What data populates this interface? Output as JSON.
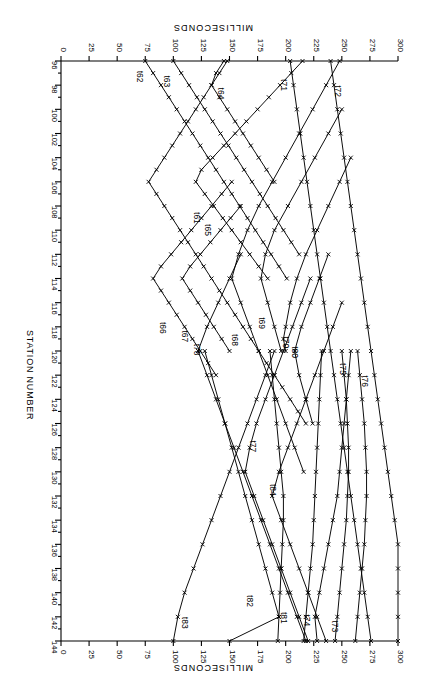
{
  "figure": {
    "rotation_deg": 180,
    "background": "#ffffff",
    "ink": "#000000",
    "marker": "x"
  },
  "axes": {
    "time_axis": {
      "title": "MILLISECONDS",
      "title_top": "MILLISECONDS",
      "title_bottom": "MILLISECONDS",
      "unit": "ms",
      "min": 0,
      "max": 300,
      "tick_step": 25,
      "ticks": [
        300,
        275,
        250,
        225,
        200,
        175,
        150,
        125,
        100,
        75,
        50,
        25,
        0
      ],
      "tick_labels": [
        "300",
        "275",
        "250",
        "225",
        "200",
        "175",
        "150",
        "125",
        "100",
        "75",
        "50",
        "25",
        "0"
      ],
      "direction": "decreasing-left-to-right"
    },
    "station_axis": {
      "title": "STATION NUMBER",
      "min": 96,
      "max": 144,
      "tick_step": 2,
      "minor_step": 1,
      "ticks": [
        96,
        98,
        100,
        102,
        104,
        106,
        108,
        110,
        112,
        114,
        116,
        118,
        120,
        122,
        124,
        126,
        128,
        130,
        132,
        134,
        136,
        138,
        140,
        142,
        144
      ],
      "tick_labels": [
        "96",
        "98",
        "100",
        "102",
        "104",
        "106",
        "108",
        "110",
        "112",
        "114",
        "116",
        "118",
        "120",
        "122",
        "124",
        "126",
        "128",
        "130",
        "132",
        "134",
        "136",
        "138",
        "140",
        "142",
        "144"
      ]
    }
  },
  "chart_data": {
    "type": "line",
    "title": "",
    "subtitle": "",
    "xlabel": "MILLISECONDS",
    "ylabel": "STATION NUMBER",
    "xlim": [
      0,
      300
    ],
    "ylim": [
      96,
      144
    ],
    "grid": false,
    "legend": "inline-curve-labels",
    "marker": "x",
    "x_is_time_ms": true,
    "series": [
      {
        "name": "t61",
        "label": "t61",
        "shot_station": 106,
        "label_station": 108.5,
        "label_time_ms": 118,
        "stations": [
          96,
          97,
          98,
          99,
          100,
          101,
          102,
          103,
          104,
          105,
          106,
          107,
          108,
          109,
          110,
          111,
          112,
          113,
          114,
          115,
          116,
          117,
          118,
          119,
          120,
          121,
          122,
          123,
          124,
          125,
          126
        ],
        "times_ms": [
          148,
          141,
          134,
          127,
          120,
          113,
          106,
          99,
          92,
          85,
          78,
          85,
          92,
          99,
          106,
          113,
          120,
          127,
          134,
          141,
          148,
          155,
          162,
          169,
          176,
          183,
          190,
          197,
          204,
          211,
          218
        ]
      },
      {
        "name": "t62",
        "label": "t62",
        "shot_station": 96,
        "label_station": 96.8,
        "label_time_ms": 68,
        "stations": [
          96,
          97,
          98,
          99,
          100,
          101,
          102,
          103,
          104,
          105,
          106,
          107,
          108,
          109,
          110,
          111,
          112,
          113,
          114
        ],
        "times_ms": [
          75,
          82,
          89,
          96,
          103,
          110,
          117,
          124,
          131,
          138,
          145,
          152,
          159,
          166,
          173,
          180,
          187,
          194,
          201
        ]
      },
      {
        "name": "t63",
        "label": "t63",
        "shot_station": 96,
        "label_station": 97.2,
        "label_time_ms": 92,
        "stations": [
          96,
          97,
          98,
          99,
          100,
          101,
          102,
          103,
          104,
          105,
          106,
          107,
          108,
          109,
          110,
          111,
          112
        ],
        "times_ms": [
          100,
          107,
          114,
          121,
          128,
          135,
          142,
          149,
          156,
          163,
          170,
          177,
          184,
          191,
          198,
          205,
          212
        ]
      },
      {
        "name": "t64",
        "label": "t64",
        "shot_station": 97,
        "label_station": 98.2,
        "label_time_ms": 140,
        "stations": [
          96,
          97,
          98,
          99,
          100,
          101,
          102,
          103,
          104,
          105,
          106
        ],
        "times_ms": [
          145,
          138,
          134,
          141,
          148,
          155,
          162,
          169,
          176,
          183,
          190
        ]
      },
      {
        "name": "t65",
        "label": "t65",
        "shot_station": 106,
        "label_station": 109.5,
        "label_time_ms": 128,
        "stations": [
          96,
          97,
          98,
          99,
          100,
          101,
          102,
          103,
          104,
          105,
          106,
          107,
          108,
          109,
          110,
          111,
          112,
          113,
          114
        ],
        "times_ms": [
          215,
          205,
          195,
          185,
          175,
          165,
          155,
          145,
          135,
          125,
          120,
          128,
          136,
          144,
          152,
          160,
          168,
          176,
          184
        ]
      },
      {
        "name": "t66",
        "label": "t66",
        "shot_station": 114,
        "label_station": 117.6,
        "label_time_ms": 88,
        "stations": [
          106,
          107,
          108,
          109,
          110,
          111,
          112,
          113,
          114,
          115,
          116,
          117,
          118,
          119,
          120,
          121,
          122
        ],
        "times_ms": [
          152,
          143,
          134,
          125,
          116,
          107,
          98,
          89,
          82,
          89,
          96,
          103,
          110,
          117,
          124,
          131,
          138
        ]
      },
      {
        "name": "t67",
        "label": "t67",
        "shot_station": 114,
        "label_station": 118.3,
        "label_time_ms": 108,
        "stations": [
          108,
          109,
          110,
          111,
          112,
          113,
          114,
          115,
          116,
          117,
          118,
          119,
          120
        ],
        "times_ms": [
          160,
          151,
          142,
          133,
          124,
          115,
          108,
          115,
          122,
          129,
          136,
          143,
          150
        ]
      },
      {
        "name": "t68",
        "label": "t68",
        "shot_station": 114,
        "label_station": 118.6,
        "label_time_ms": 152,
        "stations": [
          96,
          98,
          100,
          102,
          104,
          106,
          108,
          110,
          112,
          114,
          116,
          118,
          120,
          122,
          124,
          126,
          128,
          130
        ],
        "times_ms": [
          248,
          236,
          224,
          212,
          200,
          188,
          176,
          166,
          158,
          152,
          160,
          168,
          176,
          184,
          192,
          200,
          208,
          216
        ]
      },
      {
        "name": "t69",
        "label": "t69",
        "shot_station": 114,
        "label_station": 117.2,
        "label_time_ms": 176,
        "stations": [
          100,
          102,
          104,
          106,
          108,
          110,
          112,
          114,
          116,
          118,
          120
        ],
        "times_ms": [
          250,
          238,
          226,
          214,
          202,
          190,
          182,
          178,
          184,
          190,
          196
        ]
      },
      {
        "name": "t70",
        "label": "t70",
        "shot_station": 119,
        "label_station": 118.8,
        "label_time_ms": 198,
        "stations": [
          104,
          106,
          108,
          110,
          112,
          114,
          116,
          118,
          119,
          120
        ],
        "times_ms": [
          258,
          248,
          238,
          228,
          218,
          210,
          204,
          200,
          198,
          200
        ]
      },
      {
        "name": "t71",
        "label": "t71",
        "shot_station": 96,
        "label_station": 97.5,
        "label_time_ms": 196,
        "stations": [
          96,
          98,
          100,
          102,
          104,
          106,
          108,
          110,
          112,
          114,
          116,
          118,
          120,
          122,
          124,
          126,
          128,
          130,
          132,
          134,
          136,
          138,
          140,
          142,
          144
        ],
        "times_ms": [
          204,
          207,
          210,
          213,
          216,
          219,
          222,
          225,
          228,
          231,
          234,
          237,
          240,
          243,
          246,
          249,
          252,
          255,
          258,
          261,
          264,
          267,
          270,
          273,
          276
        ]
      },
      {
        "name": "t72",
        "label": "t72",
        "shot_station": 96,
        "label_station": 98.0,
        "label_time_ms": 244,
        "stations": [
          96,
          98,
          100,
          102,
          104,
          106,
          108,
          110,
          112,
          114,
          116,
          118,
          120,
          122,
          124,
          126,
          128,
          130,
          132,
          134,
          136,
          138,
          140,
          142,
          144
        ],
        "times_ms": [
          240,
          243,
          246,
          249,
          252,
          255,
          258,
          261,
          264,
          267,
          270,
          273,
          276,
          279,
          282,
          285,
          288,
          291,
          294,
          297,
          300,
          300,
          300,
          300,
          300
        ]
      },
      {
        "name": "t73",
        "label": "t73",
        "shot_station": 144,
        "label_station": 142.3,
        "label_time_ms": 241,
        "stations": [
          120,
          122,
          124,
          126,
          128,
          130,
          132,
          134,
          136,
          138,
          140,
          142,
          144
        ],
        "times_ms": [
          258,
          256,
          254,
          252,
          250,
          248,
          246,
          242,
          238,
          234,
          230,
          226,
          228
        ]
      },
      {
        "name": "t74",
        "label": "t74",
        "shot_station": 144,
        "label_station": 141.8,
        "label_time_ms": 216,
        "stations": [
          120,
          122,
          124,
          126,
          128,
          130,
          132,
          134,
          136,
          138,
          140,
          142,
          144
        ],
        "times_ms": [
          232,
          231,
          230,
          229,
          228,
          227,
          226,
          225,
          224,
          222,
          220,
          218,
          216
        ]
      },
      {
        "name": "t75",
        "label": "t75",
        "shot_station": 144,
        "label_station": 121.0,
        "label_time_ms": 248,
        "stations": [
          120,
          122,
          124,
          126,
          128,
          130,
          132,
          134,
          136,
          138,
          140,
          142,
          144
        ],
        "times_ms": [
          250,
          252,
          254,
          255,
          256,
          256,
          255,
          254,
          252,
          250,
          248,
          246,
          244
        ]
      },
      {
        "name": "t76",
        "label": "t76",
        "shot_station": 144,
        "label_station": 122.0,
        "label_time_ms": 268,
        "stations": [
          120,
          122,
          124,
          126,
          128,
          130,
          132,
          134,
          136,
          138,
          140,
          142,
          144
        ],
        "times_ms": [
          264,
          266,
          268,
          270,
          271,
          272,
          272,
          271,
          270,
          268,
          266,
          264,
          262
        ]
      },
      {
        "name": "t77",
        "label": "t77",
        "shot_station": 130,
        "label_station": 127.4,
        "label_time_ms": 168,
        "stations": [
          114,
          116,
          118,
          120,
          122,
          124,
          126,
          128,
          130,
          132,
          134,
          136,
          138,
          140,
          142,
          144
        ],
        "times_ms": [
          222,
          214,
          206,
          198,
          190,
          182,
          174,
          168,
          164,
          172,
          180,
          188,
          196,
          204,
          212,
          220
        ]
      },
      {
        "name": "t78",
        "label": "t78",
        "shot_station": 120,
        "label_station": 119.4,
        "label_time_ms": 118,
        "stations": [
          112,
          114,
          116,
          118,
          120,
          122,
          124,
          126,
          128,
          130,
          132,
          134,
          136,
          138,
          140,
          142,
          144
        ],
        "times_ms": [
          160,
          150,
          140,
          130,
          122,
          130,
          138,
          146,
          154,
          162,
          170,
          178,
          186,
          194,
          202,
          210,
          218
        ]
      },
      {
        "name": "t80",
        "label": "t80",
        "shot_station": 120,
        "label_station": 119.6,
        "label_time_ms": 206,
        "stations": [
          112,
          114,
          116,
          118,
          120,
          122,
          124,
          126
        ],
        "times_ms": [
          238,
          230,
          222,
          214,
          208,
          212,
          218,
          224
        ]
      },
      {
        "name": "t81",
        "label": "t81",
        "shot_station": 144,
        "label_station": 141.6,
        "label_time_ms": 196,
        "stations": [
          120,
          122,
          124,
          126,
          128,
          130,
          132,
          134,
          136,
          138,
          140,
          142,
          144
        ],
        "times_ms": [
          186,
          188,
          190,
          192,
          194,
          196,
          198,
          198,
          197,
          196,
          195,
          194,
          193
        ]
      },
      {
        "name": "t82",
        "label": "t82",
        "shot_station": 144,
        "label_station": 140.2,
        "label_time_ms": 166,
        "stations": [
          120,
          122,
          124,
          126,
          128,
          130,
          132,
          134,
          136,
          138,
          140,
          142,
          144
        ],
        "times_ms": [
          128,
          134,
          140,
          146,
          152,
          158,
          164,
          170,
          176,
          182,
          188,
          194,
          150
        ]
      },
      {
        "name": "t83",
        "label": "t83",
        "shot_station": 144,
        "label_station": 142.0,
        "label_time_ms": 108,
        "stations": [
          120,
          122,
          124,
          126,
          128,
          130,
          132,
          134,
          136,
          138,
          140,
          142,
          144
        ],
        "times_ms": [
          190,
          182,
          174,
          166,
          158,
          150,
          142,
          134,
          126,
          118,
          110,
          104,
          100
        ]
      },
      {
        "name": "t84",
        "label": "t84",
        "shot_station": 132,
        "label_station": 131.0,
        "label_time_ms": 186,
        "stations": [
          116,
          118,
          120,
          122,
          124,
          126,
          128,
          130,
          132,
          134,
          136,
          138,
          140,
          142,
          144
        ],
        "times_ms": [
          250,
          242,
          234,
          226,
          218,
          210,
          202,
          194,
          188,
          196,
          204,
          212,
          220,
          228,
          236
        ]
      }
    ]
  },
  "curve_labels": [
    {
      "text": "t61"
    },
    {
      "text": "t62"
    },
    {
      "text": "t63"
    },
    {
      "text": "t64"
    },
    {
      "text": "t65"
    },
    {
      "text": "t66"
    },
    {
      "text": "t67"
    },
    {
      "text": "t68"
    },
    {
      "text": "t69"
    },
    {
      "text": "t70"
    },
    {
      "text": "t71"
    },
    {
      "text": "t72"
    },
    {
      "text": "t73"
    },
    {
      "text": "t74"
    },
    {
      "text": "t75"
    },
    {
      "text": "t76"
    },
    {
      "text": "t77"
    },
    {
      "text": "t78"
    },
    {
      "text": "t80"
    },
    {
      "text": "t81"
    },
    {
      "text": "t82"
    },
    {
      "text": "t83"
    },
    {
      "text": "t84"
    }
  ]
}
